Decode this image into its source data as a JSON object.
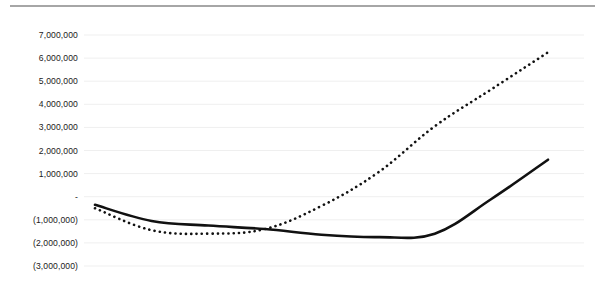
{
  "chart_data": {
    "type": "line",
    "title": "",
    "subtitle": "",
    "xlabel": "",
    "ylabel": "",
    "ylim": [
      -3000000,
      7000000
    ],
    "xlim": [
      0,
      8
    ],
    "grid": true,
    "grid_axis": "y",
    "legend_position": "none",
    "y_tick_values": [
      7000000,
      6000000,
      5000000,
      4000000,
      3000000,
      2000000,
      1000000,
      0,
      -1000000,
      -2000000,
      -3000000
    ],
    "y_tick_labels": [
      "7,000,000",
      "6,000,000",
      "5,000,000",
      "4,000,000",
      "3,000,000",
      "2,000,000",
      "1,000,000",
      "-",
      "(1,000,000)",
      "(2,000,000)",
      "(3,000,000)"
    ],
    "x": [
      0,
      1,
      2,
      3,
      4,
      5,
      6,
      7,
      8
    ],
    "x_tick_labels": [
      "",
      "",
      "",
      "",
      "",
      "",
      "",
      "",
      ""
    ],
    "series": [
      {
        "name": "Series 1",
        "style": "solid",
        "color": "#111111",
        "width": 2.6,
        "values": [
          -350000,
          -1050000,
          -1250000,
          -1400000,
          -1650000,
          -1750000,
          -1600000,
          -100000,
          1600000
        ]
      },
      {
        "name": "Series 2",
        "style": "dotted",
        "color": "#111111",
        "width": 2.6,
        "values": [
          -500000,
          -1450000,
          -1600000,
          -1400000,
          -400000,
          1050000,
          3050000,
          4650000,
          6250000
        ]
      }
    ],
    "colors": {
      "gridline": "#efefef",
      "rule": "#a6a6a6",
      "text": "#1a1a1a",
      "background": "#ffffff"
    }
  }
}
